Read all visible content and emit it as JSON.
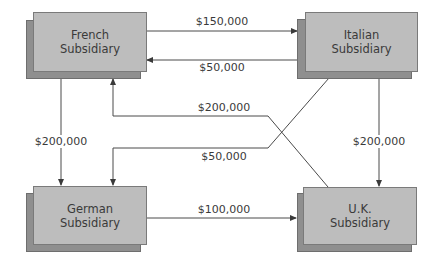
{
  "diagram": {
    "type": "intercompany-payment-flows",
    "nodes": [
      {
        "id": "french",
        "label_line1": "French",
        "label_line2": "Subsidiary"
      },
      {
        "id": "italian",
        "label_line1": "Italian",
        "label_line2": "Subsidiary"
      },
      {
        "id": "german",
        "label_line1": "German",
        "label_line2": "Subsidiary"
      },
      {
        "id": "uk",
        "label_line1": "U.K.",
        "label_line2": "Subsidiary"
      }
    ],
    "edges": [
      {
        "from": "french",
        "to": "italian",
        "label": "$150,000"
      },
      {
        "from": "italian",
        "to": "french",
        "label": "$50,000"
      },
      {
        "from": "french",
        "to": "german",
        "label": "$200,000"
      },
      {
        "from": "uk",
        "to": "french",
        "label": "$200,000"
      },
      {
        "from": "italian",
        "to": "german",
        "label": "$50,000"
      },
      {
        "from": "italian",
        "to": "uk",
        "label": "$200,000"
      },
      {
        "from": "german",
        "to": "uk",
        "label": "$100,000"
      }
    ]
  },
  "colors": {
    "box_front": "#bdbdbd",
    "box_shadow": "#8f8f8f",
    "line": "#4a4a4a",
    "text": "#3a3a3a"
  }
}
